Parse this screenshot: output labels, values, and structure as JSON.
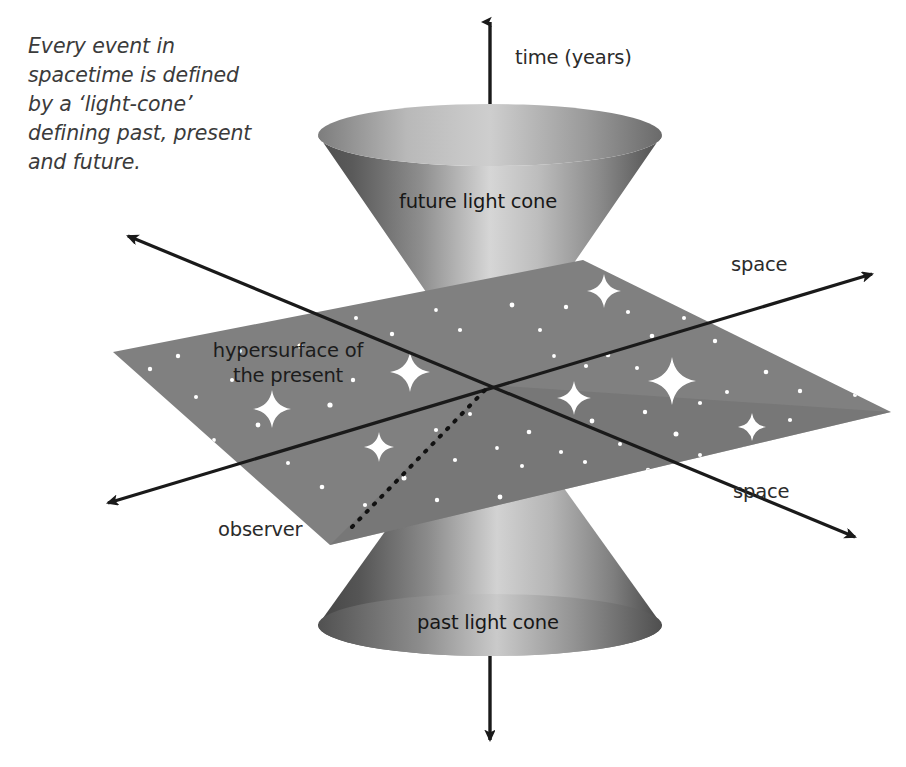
{
  "figure": {
    "kind": "spacetime-light-cone-diagram",
    "caption": "Every event in\nspacetime is defined\nby a ‘light-cone’\ndefining past, present\nand future."
  },
  "axes": {
    "time_label": "time (years)",
    "space_label_upper_right": "space",
    "space_label_lower_right": "space"
  },
  "labels": {
    "future_cone": "future light cone",
    "past_cone": "past light cone",
    "hypersurface_line1": "hypersurface of",
    "hypersurface_line2": "the present",
    "observer": "observer"
  },
  "colors": {
    "background": "#ffffff",
    "plane_fill": "#808080",
    "plane_fill_shadow": "#6e6e6e",
    "cone_dark": "#4a4a4a",
    "cone_light": "#d8d8d8",
    "cone_mid": "#8c8c8c",
    "axis_stroke": "#1a1a1a",
    "text": "#2b2b2b",
    "caption_text": "#3b3b3b",
    "star": "#ffffff"
  },
  "geometry": {
    "apex": {
      "x": 490,
      "y": 385
    },
    "time_axis_top_y": 10,
    "time_axis_bottom_y": 745,
    "future_cone_rim_y": 135,
    "past_cone_base_y": 625,
    "cone_rim_rx": 172,
    "cone_rim_ry": 31,
    "plane_corners": [
      {
        "x": 113,
        "y": 352
      },
      {
        "x": 583,
        "y": 260
      },
      {
        "x": 891,
        "y": 412
      },
      {
        "x": 330,
        "y": 545
      }
    ]
  },
  "stars": {
    "bright": [
      {
        "x": 604,
        "y": 291,
        "r": 17
      },
      {
        "x": 410,
        "y": 372,
        "r": 20
      },
      {
        "x": 272,
        "y": 409,
        "r": 19
      },
      {
        "x": 672,
        "y": 381,
        "r": 24
      },
      {
        "x": 574,
        "y": 398,
        "r": 17
      },
      {
        "x": 752,
        "y": 427,
        "r": 14
      },
      {
        "x": 379,
        "y": 447,
        "r": 15
      },
      {
        "x": 744,
        "y": 473,
        "r": 27
      }
    ],
    "dots": [
      {
        "x": 178,
        "y": 356,
        "r": 2.2
      },
      {
        "x": 232,
        "y": 380,
        "r": 2.0
      },
      {
        "x": 300,
        "y": 346,
        "r": 2.6
      },
      {
        "x": 196,
        "y": 397,
        "r": 2.0
      },
      {
        "x": 258,
        "y": 425,
        "r": 2.4
      },
      {
        "x": 214,
        "y": 440,
        "r": 1.9
      },
      {
        "x": 330,
        "y": 405,
        "r": 2.6
      },
      {
        "x": 353,
        "y": 380,
        "r": 2.2
      },
      {
        "x": 288,
        "y": 463,
        "r": 2.0
      },
      {
        "x": 322,
        "y": 487,
        "r": 2.3
      },
      {
        "x": 365,
        "y": 505,
        "r": 2.1
      },
      {
        "x": 404,
        "y": 478,
        "r": 2.5
      },
      {
        "x": 437,
        "y": 500,
        "r": 2.2
      },
      {
        "x": 470,
        "y": 521,
        "r": 2.0
      },
      {
        "x": 414,
        "y": 540,
        "r": 2.3
      },
      {
        "x": 455,
        "y": 460,
        "r": 2.1
      },
      {
        "x": 500,
        "y": 497,
        "r": 2.4
      },
      {
        "x": 522,
        "y": 466,
        "r": 2.0
      },
      {
        "x": 548,
        "y": 510,
        "r": 2.2
      },
      {
        "x": 497,
        "y": 448,
        "r": 1.9
      },
      {
        "x": 529,
        "y": 432,
        "r": 2.3
      },
      {
        "x": 561,
        "y": 452,
        "r": 2.1
      },
      {
        "x": 592,
        "y": 421,
        "r": 2.4
      },
      {
        "x": 620,
        "y": 444,
        "r": 2.0
      },
      {
        "x": 645,
        "y": 412,
        "r": 2.2
      },
      {
        "x": 676,
        "y": 434,
        "r": 2.5
      },
      {
        "x": 700,
        "y": 403,
        "r": 2.1
      },
      {
        "x": 727,
        "y": 392,
        "r": 2.0
      },
      {
        "x": 766,
        "y": 372,
        "r": 2.3
      },
      {
        "x": 800,
        "y": 391,
        "r": 2.2
      },
      {
        "x": 826,
        "y": 368,
        "r": 2.0
      },
      {
        "x": 790,
        "y": 340,
        "r": 2.4
      },
      {
        "x": 757,
        "y": 325,
        "r": 2.1
      },
      {
        "x": 715,
        "y": 341,
        "r": 2.2
      },
      {
        "x": 684,
        "y": 318,
        "r": 2.0
      },
      {
        "x": 652,
        "y": 336,
        "r": 2.3
      },
      {
        "x": 628,
        "y": 312,
        "r": 2.1
      },
      {
        "x": 566,
        "y": 307,
        "r": 2.2
      },
      {
        "x": 540,
        "y": 330,
        "r": 2.0
      },
      {
        "x": 512,
        "y": 305,
        "r": 2.4
      },
      {
        "x": 460,
        "y": 330,
        "r": 2.1
      },
      {
        "x": 436,
        "y": 310,
        "r": 1.9
      },
      {
        "x": 392,
        "y": 334,
        "r": 2.2
      },
      {
        "x": 356,
        "y": 318,
        "r": 2.0
      },
      {
        "x": 240,
        "y": 351,
        "r": 2.0
      },
      {
        "x": 150,
        "y": 369,
        "r": 2.2
      },
      {
        "x": 608,
        "y": 355,
        "r": 2.3
      },
      {
        "x": 637,
        "y": 368,
        "r": 2.0
      },
      {
        "x": 586,
        "y": 366,
        "r": 2.1
      },
      {
        "x": 554,
        "y": 356,
        "r": 1.9
      },
      {
        "x": 700,
        "y": 455,
        "r": 2.0
      },
      {
        "x": 790,
        "y": 420,
        "r": 2.1
      },
      {
        "x": 855,
        "y": 395,
        "r": 2.0
      },
      {
        "x": 648,
        "y": 470,
        "r": 2.2
      },
      {
        "x": 606,
        "y": 487,
        "r": 2.0
      },
      {
        "x": 585,
        "y": 462,
        "r": 2.1
      },
      {
        "x": 488,
        "y": 536,
        "r": 2.2
      },
      {
        "x": 542,
        "y": 540,
        "r": 2.0
      },
      {
        "x": 436,
        "y": 430,
        "r": 2.1
      },
      {
        "x": 470,
        "y": 414,
        "r": 2.0
      }
    ]
  }
}
